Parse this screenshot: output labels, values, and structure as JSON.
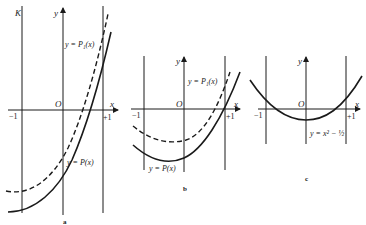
{
  "figure": {
    "panels": [
      {
        "id": "a",
        "caption": "a",
        "corner_label": "K",
        "axis_x": "x",
        "axis_y": "y",
        "origin": "O",
        "tick_left": "−1",
        "tick_right": "+1",
        "curve_dashed_label": "y = P₁(x)",
        "curve_solid_label": "y = P(x)"
      },
      {
        "id": "b",
        "caption": "b",
        "axis_x": "x",
        "axis_y": "y",
        "origin": "O",
        "tick_left": "−1",
        "tick_right": "+1",
        "curve_dashed_label": "y = P₁(x)",
        "curve_solid_label": "y = P(x)"
      },
      {
        "id": "c",
        "caption": "c",
        "axis_x": "x",
        "axis_y": "y",
        "origin": "O",
        "tick_left": "−1",
        "tick_right": "+1",
        "curve_solid_label": "y = x² − ½"
      }
    ],
    "colors": {
      "ink": "#1a1a1a",
      "background": "#ffffff"
    }
  }
}
